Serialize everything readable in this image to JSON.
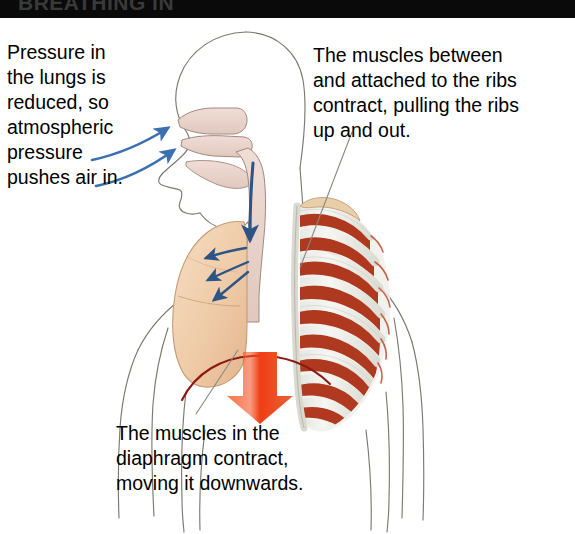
{
  "figure": {
    "title_band": "BREATHING IN",
    "background_color": "#ffffff",
    "band_color": "#0a0a0a"
  },
  "callouts": {
    "lungs": {
      "id": "pressure-in-lungs",
      "text": "Pressure in\nthe lungs is\nreduced, so\natmospheric\npressure\npushes air in."
    },
    "ribs": {
      "id": "intercostal-muscles",
      "text": "The muscles between\nand attached to the ribs\ncontract, pulling the ribs\nup and out."
    },
    "diaphragm": {
      "id": "diaphragm-contraction",
      "text": "The muscles in the\ndiaphragm contract,\nmoving it downwards."
    }
  },
  "anatomy": {
    "body_outline": {
      "name": "body-outline",
      "stroke": "#7a7a72"
    },
    "airway": {
      "name": "nasal-cavity-mouth-trachea",
      "fill": "#e8d3cb",
      "stroke": "#a08a80"
    },
    "lung": {
      "name": "left-lung",
      "fill": "#efcba8",
      "stroke": "#c79a74"
    },
    "ribs": {
      "name": "rib-cage",
      "fill": "#eff0ea",
      "stroke": "#b8b8ae"
    },
    "intercostal_muscle": {
      "name": "intercostal-muscle",
      "fill": "#b03a20"
    },
    "diaphragm_line": {
      "name": "diaphragm",
      "stroke": "#8c1a12"
    },
    "airflow_arrows": {
      "name": "airflow-arrow",
      "color": "#3a6fb0"
    },
    "bronchi_arrows": {
      "name": "bronchi-airflow-arrow",
      "color": "#2d5486"
    },
    "trachea_arrow": {
      "name": "trachea-airflow-arrow",
      "color": "#2d5486"
    },
    "diaphragm_arrow": {
      "name": "diaphragm-movement-arrow",
      "color": "#f04a20"
    },
    "leader_lines": {
      "name": "leader-line",
      "stroke": "#888880"
    }
  }
}
